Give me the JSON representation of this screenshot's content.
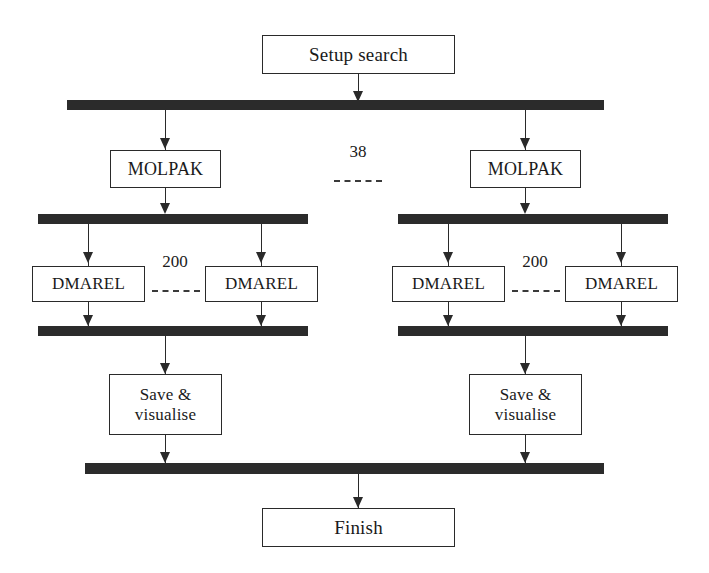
{
  "diagram": {
    "type": "flowchart",
    "colors": {
      "bar": "#2b2b2b",
      "line": "#2a2a2a",
      "box_border": "#2a2a2a",
      "box_fill": "#ffffff",
      "text": "#1a1a1a",
      "background": "#ffffff"
    },
    "nodes": {
      "start": {
        "label": "Setup search"
      },
      "molpak_left": {
        "label": "MOLPAK"
      },
      "molpak_right": {
        "label": "MOLPAK"
      },
      "dmarel_left_1": {
        "label": "DMAREL"
      },
      "dmarel_left_2": {
        "label": "DMAREL"
      },
      "dmarel_right_1": {
        "label": "DMAREL"
      },
      "dmarel_right_2": {
        "label": "DMAREL"
      },
      "save_left": {
        "label": "Save &\nvisualise"
      },
      "save_right": {
        "label": "Save &\nvisualise"
      },
      "finish": {
        "label": "Finish"
      }
    },
    "multiplicities": {
      "molpak_branches": "38",
      "dmarel_left_branches": "200",
      "dmarel_right_branches": "200"
    },
    "bars": {
      "fork_top": "fork-bar",
      "fork_left_mid": "fork-bar",
      "fork_right_mid": "fork-bar",
      "join_left": "join-bar",
      "join_right": "join-bar",
      "join_bottom": "join-bar"
    }
  }
}
